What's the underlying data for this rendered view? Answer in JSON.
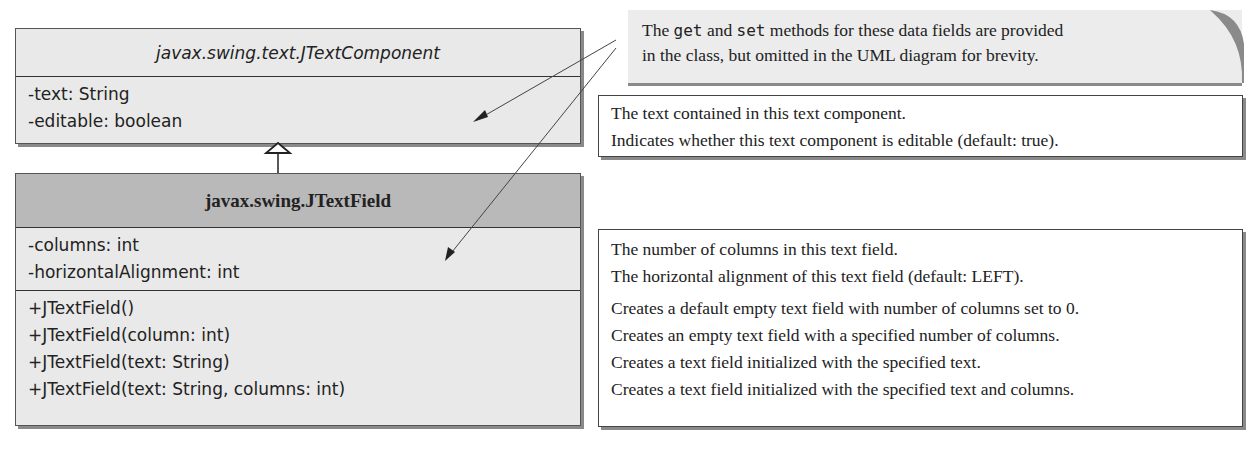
{
  "superclass": {
    "name": "javax.swing.text.JTextComponent",
    "fields": [
      "-text: String",
      "-editable: boolean"
    ]
  },
  "subclass": {
    "name": "javax.swing.JTextField",
    "fields": [
      "-columns: int",
      "-horizontalAlignment: int"
    ],
    "methods": [
      "+JTextField()",
      "+JTextField(column: int)",
      "+JTextField(text: String)",
      "+JTextField(text: String, columns: int)"
    ]
  },
  "note": {
    "part1": "The ",
    "code1": "get",
    "part2": " and ",
    "code2": "set",
    "part3": " methods for these data fields are provided",
    "line2": "in the class, but omitted in the UML diagram for brevity."
  },
  "superclass_descriptions": [
    "The text contained in this text component.",
    "Indicates whether this text component is editable (default: true)."
  ],
  "subclass_descriptions": [
    "The number of columns in this text field.",
    "The horizontal alignment of this text field (default: LEFT).",
    "Creates a default empty text field with number of columns set to 0.",
    "Creates an empty text field with a specified number of columns.",
    "Creates a text field initialized with the specified text.",
    "Creates a text field initialized with the specified text and columns."
  ]
}
